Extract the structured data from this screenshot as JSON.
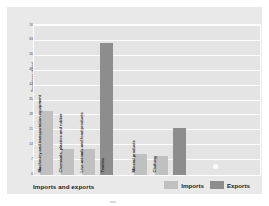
{
  "chart_data": {
    "type": "bar",
    "title": "Imports and exports",
    "xlabel": "",
    "ylabel": "Percentage of total",
    "ylim": [
      0,
      70
    ],
    "yticks": [
      0,
      7,
      14,
      21,
      28,
      35,
      42,
      49,
      56,
      63,
      70
    ],
    "grid": true,
    "legend_position": "bottom-right",
    "categories": [
      "Machinery and transportation equipment",
      "Chemicals, plastics and rubber",
      "Live animals and food products",
      "Textiles",
      "Mineral products",
      "Clothing"
    ],
    "legend": [
      {
        "name": "Imports",
        "color": "#c0c0c0"
      },
      {
        "name": "Exports",
        "color": "#8d8d8d"
      }
    ],
    "bars": [
      {
        "label": "Machinery and transportation equipment",
        "series": "Imports",
        "value": 30
      },
      {
        "label": "Chemicals, plastics and rubber",
        "series": "Imports",
        "value": 12
      },
      {
        "label": "Live animals and food products",
        "series": "Imports",
        "value": 12
      },
      {
        "label": "Textiles",
        "series": "Exports",
        "value": 62
      },
      {
        "label": "Mineral products",
        "series": "Imports",
        "value": 10
      },
      {
        "label": "Clothing",
        "series": "Imports",
        "value": 9
      },
      {
        "label": "Clothing",
        "series": "Exports",
        "value": 22
      }
    ]
  },
  "chart": {
    "title": "Imports and exports",
    "y_axis_title": "Percentage of total",
    "y_tick_labels": [
      "70",
      "63",
      "56",
      "49",
      "42",
      "35",
      "28",
      "21",
      "14",
      "7",
      "0"
    ]
  },
  "legend": {
    "items": [
      {
        "label": "Imports",
        "color": "#c0c0c0"
      },
      {
        "label": "Exports",
        "color": "#8d8d8d"
      }
    ]
  },
  "colors": {
    "imports": "#c0c0c0",
    "exports": "#8d8d8d",
    "card_background": "#e9e9e9",
    "plot_background": "#e4e4e4",
    "gridline": "#fdfdfd",
    "text": "#1b1b1b"
  }
}
